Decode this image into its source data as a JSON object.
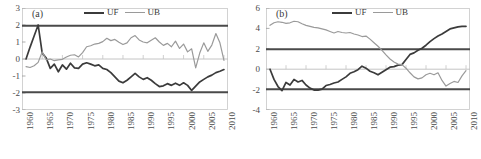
{
  "figure": {
    "panels": [
      {
        "tag": "(a)",
        "legend": [
          {
            "name": "UF",
            "color": "#3b3b3b",
            "width": 2
          },
          {
            "name": "UB",
            "color": "#9a9a9a",
            "width": 1.4
          }
        ],
        "chart_data": {
          "type": "line",
          "title": "(a)",
          "xlabel": "",
          "ylabel": "",
          "xlim": [
            1960,
            2011
          ],
          "ylim": [
            -3,
            3
          ],
          "yticks": [
            3,
            2,
            1,
            0,
            -1,
            -2,
            -3
          ],
          "xticks": [
            1960,
            1965,
            1970,
            1975,
            1980,
            1985,
            1990,
            1995,
            2000,
            2005,
            2010
          ],
          "grid": false,
          "legend_position": "top-center",
          "annotations": [
            {
              "type": "hline",
              "value": 1.96,
              "label": "+1.96 significance",
              "color": "#4a4a4a"
            },
            {
              "type": "hline",
              "value": -1.96,
              "label": "-1.96 significance",
              "color": "#4a4a4a"
            },
            {
              "type": "hline",
              "value": 0,
              "label": "zero line",
              "color": "#bdbdbd"
            }
          ],
          "x": [
            1961,
            1962,
            1963,
            1964,
            1965,
            1966,
            1967,
            1968,
            1969,
            1970,
            1971,
            1972,
            1973,
            1974,
            1975,
            1976,
            1977,
            1978,
            1979,
            1980,
            1981,
            1982,
            1983,
            1984,
            1985,
            1986,
            1987,
            1988,
            1989,
            1990,
            1991,
            1992,
            1993,
            1994,
            1995,
            1996,
            1997,
            1998,
            1999,
            2000,
            2001,
            2002,
            2003,
            2004,
            2005,
            2006,
            2007,
            2008,
            2009,
            2010
          ],
          "series": [
            {
              "name": "UF",
              "color": "#3b3b3b",
              "values": [
                0.0,
                0.7,
                1.35,
                2.0,
                0.35,
                0.05,
                -0.55,
                -0.3,
                -0.75,
                -0.35,
                -0.6,
                -0.25,
                -0.52,
                -0.55,
                -0.3,
                -0.22,
                -0.3,
                -0.4,
                -0.35,
                -0.55,
                -0.62,
                -0.8,
                -1.05,
                -1.3,
                -1.4,
                -1.25,
                -1.05,
                -0.85,
                -1.05,
                -1.2,
                -1.1,
                -1.25,
                -1.45,
                -1.62,
                -1.58,
                -1.45,
                -1.55,
                -1.42,
                -1.55,
                -1.4,
                -1.55,
                -1.85,
                -1.6,
                -1.35,
                -1.2,
                -1.05,
                -0.95,
                -0.8,
                -0.72,
                -0.62
              ]
            },
            {
              "name": "UB",
              "color": "#9a9a9a",
              "values": [
                -0.45,
                -0.5,
                -0.4,
                -0.2,
                0.42,
                -0.05,
                0.0,
                -0.1,
                -0.05,
                -0.02,
                0.12,
                0.22,
                0.25,
                0.12,
                0.38,
                0.72,
                0.78,
                0.88,
                0.92,
                1.02,
                1.22,
                1.08,
                1.15,
                0.98,
                0.85,
                0.95,
                1.25,
                1.38,
                1.12,
                1.0,
                0.95,
                1.1,
                1.25,
                1.0,
                0.8,
                0.92,
                0.72,
                1.05,
                0.62,
                0.88,
                0.42,
                0.6,
                -0.52,
                0.35,
                0.95,
                0.45,
                0.82,
                1.5,
                0.95,
                -0.08
              ]
            }
          ]
        }
      },
      {
        "tag": "(b)",
        "legend": [
          {
            "name": "UF",
            "color": "#3b3b3b",
            "width": 2
          },
          {
            "name": "UB",
            "color": "#9a9a9a",
            "width": 1.4
          }
        ],
        "chart_data": {
          "type": "line",
          "title": "(b)",
          "xlabel": "",
          "ylabel": "",
          "xlim": [
            1960,
            2011
          ],
          "ylim": [
            -4,
            6
          ],
          "yticks": [
            6,
            4,
            2,
            0,
            -2,
            -4
          ],
          "xticks": [
            1960,
            1965,
            1970,
            1975,
            1980,
            1985,
            1990,
            1995,
            2000,
            2005,
            2010
          ],
          "grid": false,
          "legend_position": "top-center",
          "annotations": [
            {
              "type": "hline",
              "value": 1.96,
              "label": "+1.96 significance",
              "color": "#4a4a4a"
            },
            {
              "type": "hline",
              "value": -1.96,
              "label": "-1.96 significance",
              "color": "#4a4a4a"
            },
            {
              "type": "hline",
              "value": 0,
              "label": "zero line",
              "color": "#bdbdbd"
            }
          ],
          "x": [
            1961,
            1962,
            1963,
            1964,
            1965,
            1966,
            1967,
            1968,
            1969,
            1970,
            1971,
            1972,
            1973,
            1974,
            1975,
            1976,
            1977,
            1978,
            1979,
            1980,
            1981,
            1982,
            1983,
            1984,
            1985,
            1986,
            1987,
            1988,
            1989,
            1990,
            1991,
            1992,
            1993,
            1994,
            1995,
            1996,
            1997,
            1998,
            1999,
            2000,
            2001,
            2002,
            2003,
            2004,
            2005,
            2006,
            2007,
            2008,
            2009,
            2010
          ],
          "series": [
            {
              "name": "UF",
              "color": "#3b3b3b",
              "values": [
                0.0,
                -1.0,
                -1.7,
                -2.1,
                -1.3,
                -1.55,
                -1.0,
                -1.25,
                -1.1,
                -1.55,
                -1.85,
                -2.05,
                -2.05,
                -1.95,
                -1.6,
                -1.5,
                -1.35,
                -1.25,
                -1.0,
                -0.75,
                -0.4,
                -0.25,
                -0.05,
                0.3,
                0.1,
                -0.2,
                -0.35,
                -0.55,
                -0.3,
                -0.05,
                0.2,
                0.25,
                0.4,
                0.45,
                0.95,
                1.45,
                1.6,
                1.85,
                2.05,
                2.35,
                2.7,
                3.0,
                3.25,
                3.45,
                3.7,
                3.95,
                4.05,
                4.15,
                4.2,
                4.2
              ]
            },
            {
              "name": "UB",
              "color": "#9a9a9a",
              "values": [
                4.3,
                4.55,
                4.65,
                4.6,
                4.5,
                4.55,
                4.7,
                4.65,
                4.45,
                4.3,
                4.2,
                4.1,
                4.05,
                3.95,
                3.85,
                3.7,
                3.55,
                3.7,
                3.6,
                3.55,
                3.6,
                3.45,
                3.35,
                3.2,
                3.25,
                2.95,
                2.6,
                2.25,
                1.85,
                1.4,
                1.0,
                0.7,
                0.5,
                0.45,
                0.1,
                -0.35,
                -0.75,
                -0.95,
                -0.85,
                -0.55,
                -0.4,
                -0.55,
                -0.35,
                -1.1,
                -1.65,
                -1.4,
                -1.2,
                -1.3,
                -0.65,
                -0.15
              ]
            }
          ]
        }
      }
    ]
  }
}
